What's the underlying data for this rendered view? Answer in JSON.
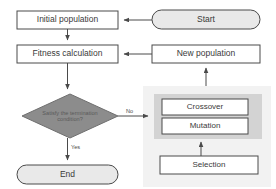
{
  "diagram": {
    "type": "flowchart",
    "colors": {
      "terminator_fill": "#e9e9e9",
      "decision_fill": "#8c8c8c",
      "process_fill": "#ffffff",
      "outer_panel_fill": "#f2f2f2",
      "inner_panel_fill": "#d3d3d3",
      "stroke": "#4a4a4a",
      "text": "#3a3a3a",
      "decision_text": "#5a5a5a"
    },
    "nodes": {
      "start": {
        "label": "Start",
        "shape": "terminator"
      },
      "initial_population": {
        "label": "Initial population",
        "shape": "process"
      },
      "fitness_calculation": {
        "label": "Fitness calculation",
        "shape": "process"
      },
      "new_population": {
        "label": "New population",
        "shape": "process"
      },
      "termination_decision": {
        "label_line1": "Satisfy the termination",
        "label_line2": "condition?",
        "shape": "decision"
      },
      "end": {
        "label": "End",
        "shape": "terminator"
      },
      "crossover": {
        "label": "Crossover",
        "shape": "process"
      },
      "mutation": {
        "label": "Mutation",
        "shape": "process"
      },
      "selection": {
        "label": "Selection",
        "shape": "process"
      }
    },
    "edge_labels": {
      "no": "No",
      "yes": "Yes"
    }
  }
}
